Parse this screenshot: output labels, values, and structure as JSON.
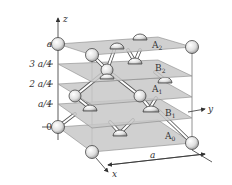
{
  "diagram": {
    "axes": {
      "x": "x",
      "y": "y",
      "z": "z"
    },
    "z_ticks": [
      "a",
      "3 a/4",
      "2 a/4",
      "a/4",
      "0"
    ],
    "planes": [
      {
        "name": "A",
        "sub": "2"
      },
      {
        "name": "B",
        "sub": "2"
      },
      {
        "name": "A",
        "sub": "1"
      },
      {
        "name": "B",
        "sub": "1"
      },
      {
        "name": "A",
        "sub": "0"
      }
    ],
    "dimension_label": "a",
    "colors": {
      "plane": "#c8c8c8",
      "atom": "#e6e6e6",
      "bond": "#555555",
      "line": "#777777"
    }
  }
}
